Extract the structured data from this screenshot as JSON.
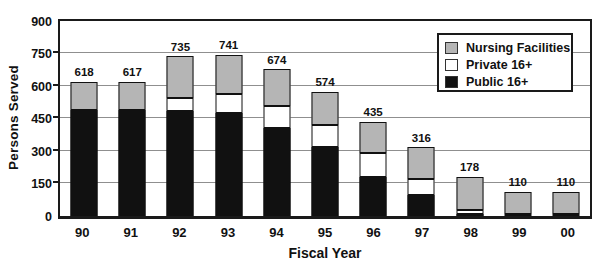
{
  "chart_data": {
    "type": "bar",
    "stacked": true,
    "title": "",
    "xlabel": "Fiscal Year",
    "ylabel": "Persons Served",
    "ylim": [
      0,
      900
    ],
    "yticks": [
      0,
      150,
      300,
      450,
      600,
      750,
      900
    ],
    "grid": true,
    "legend_position": "top-right",
    "categories": [
      "90",
      "91",
      "92",
      "93",
      "94",
      "95",
      "96",
      "97",
      "98",
      "99",
      "00"
    ],
    "series": [
      {
        "name": "Public 16+",
        "color": "#111111",
        "values": [
          490,
          490,
          485,
          475,
          405,
          320,
          180,
          95,
          10,
          0,
          0
        ]
      },
      {
        "name": "Private 16+",
        "color": "#ffffff",
        "values": [
          0,
          0,
          58,
          86,
          100,
          100,
          113,
          73,
          17,
          8,
          8
        ]
      },
      {
        "name": "Nursing Facilities",
        "color": "#b5b5b5",
        "values": [
          128,
          127,
          192,
          180,
          169,
          154,
          142,
          148,
          151,
          102,
          102
        ]
      }
    ],
    "totals": [
      618,
      617,
      735,
      741,
      674,
      574,
      435,
      316,
      178,
      110,
      110
    ]
  },
  "colors": {
    "frame": "#1a1a1a",
    "gridline": "#8f8f8f",
    "background": "#ffffff"
  }
}
